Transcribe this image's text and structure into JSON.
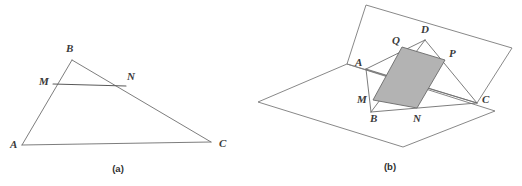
{
  "document": {
    "title": "Geometry figures: midsegment of a triangle and cross-section quadrilateral",
    "background_color": "#ffffff",
    "line_color": "#6e6e6e",
    "label_color": "#3a3a3a",
    "shade_color": "#b3b3b3"
  },
  "figures": [
    {
      "id": "figure-a",
      "caption": "(a)",
      "caption_position": {
        "x": 118,
        "y": 172
      },
      "description": "Triangle ABC with midsegment MN joining points on AB and BC",
      "points": [
        {
          "name": "A",
          "label": "A",
          "x": 22,
          "y": 145,
          "label_x": 10,
          "label_y": 148
        },
        {
          "name": "B",
          "label": "B",
          "x": 72,
          "y": 60,
          "label_x": 66,
          "label_y": 52
        },
        {
          "name": "C",
          "label": "C",
          "x": 211,
          "y": 142,
          "label_x": 219,
          "label_y": 147
        },
        {
          "name": "M",
          "label": "M",
          "x": 53,
          "y": 84,
          "label_x": 39,
          "label_y": 85
        },
        {
          "name": "N",
          "label": "N",
          "x": 126,
          "y": 86,
          "label_x": 127,
          "label_y": 80
        }
      ],
      "segments": [
        {
          "name": "AB",
          "from": "A",
          "to": "B",
          "style": "thin"
        },
        {
          "name": "BC",
          "from": "B",
          "to": "C",
          "style": "thin"
        },
        {
          "name": "AC",
          "from": "A",
          "to": "C",
          "style": "thin"
        },
        {
          "name": "MN",
          "from": "M",
          "to": "N",
          "style": "thick"
        }
      ]
    },
    {
      "id": "figure-b",
      "caption": "(b)",
      "caption_position": {
        "x": 390,
        "y": 170
      },
      "description": "Two intersecting planes containing tetrahedron ABCD with shaded parallelogram cross-section MNPQ",
      "points": [
        {
          "name": "A",
          "label": "A",
          "x": 366,
          "y": 69,
          "label_x": 355,
          "label_y": 66
        },
        {
          "name": "B",
          "label": "B",
          "x": 371,
          "y": 112,
          "label_x": 370,
          "label_y": 122
        },
        {
          "name": "C",
          "label": "C",
          "x": 477,
          "y": 103,
          "label_x": 482,
          "label_y": 103
        },
        {
          "name": "D",
          "label": "D",
          "x": 425,
          "y": 40,
          "label_x": 421,
          "label_y": 33
        },
        {
          "name": "M",
          "label": "M",
          "x": 373,
          "y": 100,
          "label_x": 359,
          "label_y": 101
        },
        {
          "name": "N",
          "label": "N",
          "x": 417,
          "y": 108,
          "label_x": 414,
          "label_y": 121
        },
        {
          "name": "P",
          "label": "P",
          "x": 445,
          "y": 60,
          "label_x": 449,
          "label_y": 57
        },
        {
          "name": "Q",
          "label": "Q",
          "x": 402,
          "y": 47,
          "label_x": 393,
          "label_y": 43
        }
      ],
      "planes": [
        {
          "name": "upper-plane",
          "vertices": [
            [
              366,
              5
            ],
            [
              512,
              48
            ],
            [
              477,
              103
            ],
            [
              347,
              64
            ]
          ]
        },
        {
          "name": "lower-plane",
          "vertices": [
            [
              347,
              64
            ],
            [
              495,
              111
            ],
            [
              403,
              147
            ],
            [
              258,
              102
            ]
          ]
        }
      ],
      "shaded_quad": {
        "name": "MNPQ",
        "vertices": [
          "M",
          "N",
          "P",
          "Q"
        ],
        "fill": "#b3b3b3"
      },
      "segments": [
        {
          "name": "AB",
          "from": "A",
          "to": "B",
          "style": "thin"
        },
        {
          "name": "AC",
          "from": "A",
          "to": "C",
          "style": "thin"
        },
        {
          "name": "AD",
          "from": "A",
          "to": "D",
          "style": "thin"
        },
        {
          "name": "BC",
          "from": "B",
          "to": "C",
          "style": "thin"
        },
        {
          "name": "BD",
          "from": "B",
          "to": "D",
          "style": "thin"
        },
        {
          "name": "DC",
          "from": "D",
          "to": "C",
          "style": "thin"
        }
      ]
    }
  ]
}
